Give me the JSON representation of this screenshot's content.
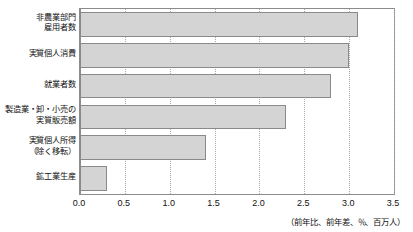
{
  "chart_data": {
    "type": "bar",
    "orientation": "horizontal",
    "title": "",
    "xlabel": "",
    "ylabel": "",
    "xlim": [
      0.0,
      3.5
    ],
    "grid": true,
    "legend": null,
    "categories": [
      "非農業部門\n雇用者数",
      "実質個人消費",
      "就業者数",
      "製造業・卸・小売の\n実質販売額",
      "実質個人所得\n（除く移転）",
      "鉱工業生産"
    ],
    "values": [
      3.1,
      3.0,
      2.8,
      2.3,
      1.4,
      0.3
    ],
    "xticks": [
      0.0,
      0.5,
      1.0,
      1.5,
      2.0,
      2.5,
      3.0,
      3.5
    ],
    "xticklabels": [
      "0.0",
      "0.5",
      "1.0",
      "1.5",
      "2.0",
      "2.5",
      "3.0",
      "3.5"
    ],
    "annotations": {
      "units_note": "（前年比、前年差、％、百万人）"
    },
    "colors": {
      "bar_fill": "#d4d4d4",
      "bar_edge": "#8a8a8a",
      "frame": "#8c8c8c",
      "gridline": "#a8a8a8",
      "text": "#111111",
      "background": "#ffffff"
    }
  }
}
